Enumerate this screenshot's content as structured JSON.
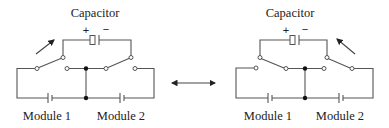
{
  "diagram": {
    "left_circuit": {
      "capacitor_label": "Capacitor",
      "plus_sign": "+",
      "minus_sign": "−",
      "module_1_label": "Module 1",
      "module_2_label": "Module 2",
      "switch_state": "capacitor connected across Module 1"
    },
    "right_circuit": {
      "capacitor_label": "Capacitor",
      "plus_sign": "+",
      "minus_sign": "−",
      "module_1_label": "Module 1",
      "module_2_label": "Module 2",
      "switch_state": "capacitor connected across Module 2"
    },
    "transition_arrow": "double-headed arrow between configurations"
  }
}
